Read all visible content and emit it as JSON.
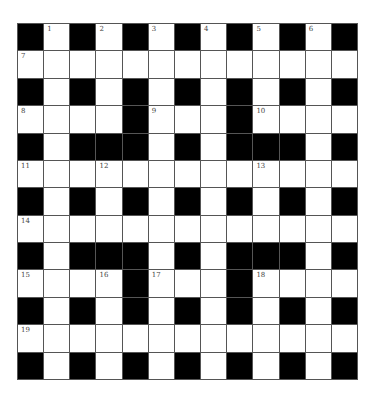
{
  "puzzle": {
    "rows": 13,
    "cols": 13,
    "grid": [
      "#.#.#.#.#.#.#",
      ".............",
      "#.#.#.#.#.#.#",
      "....#...#....",
      "#.###.#.###.#",
      ".............",
      "#.#.#.#.#.#.#",
      ".............",
      "#.###.#.###.#",
      "....#...#....",
      "#.#.#.#.#.#.#",
      ".............",
      "#.#.#.#.#.#.#"
    ],
    "numbers": [
      {
        "r": 0,
        "c": 1,
        "n": "1"
      },
      {
        "r": 0,
        "c": 3,
        "n": "2"
      },
      {
        "r": 0,
        "c": 5,
        "n": "3"
      },
      {
        "r": 0,
        "c": 7,
        "n": "4"
      },
      {
        "r": 0,
        "c": 9,
        "n": "5"
      },
      {
        "r": 0,
        "c": 11,
        "n": "6"
      },
      {
        "r": 1,
        "c": 0,
        "n": "7"
      },
      {
        "r": 3,
        "c": 0,
        "n": "8"
      },
      {
        "r": 3,
        "c": 5,
        "n": "9"
      },
      {
        "r": 3,
        "c": 9,
        "n": "10"
      },
      {
        "r": 5,
        "c": 0,
        "n": "11"
      },
      {
        "r": 5,
        "c": 3,
        "n": "12"
      },
      {
        "r": 5,
        "c": 9,
        "n": "13"
      },
      {
        "r": 7,
        "c": 0,
        "n": "14"
      },
      {
        "r": 9,
        "c": 0,
        "n": "15"
      },
      {
        "r": 9,
        "c": 3,
        "n": "16"
      },
      {
        "r": 9,
        "c": 5,
        "n": "17"
      },
      {
        "r": 9,
        "c": 9,
        "n": "18"
      },
      {
        "r": 11,
        "c": 0,
        "n": "19"
      }
    ],
    "colors": {
      "block": "#000000",
      "cell": "#ffffff",
      "border": "#555555"
    }
  }
}
